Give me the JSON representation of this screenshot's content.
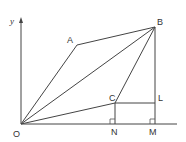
{
  "diagram": {
    "axis_label_y": "y",
    "points": {
      "O": {
        "label": "O",
        "x": 21,
        "y": 124
      },
      "A": {
        "label": "A",
        "x": 77,
        "y": 45
      },
      "B": {
        "label": "B",
        "x": 155,
        "y": 27
      },
      "C": {
        "label": "C",
        "x": 115,
        "y": 103
      },
      "L": {
        "label": "L",
        "x": 155,
        "y": 103
      },
      "N": {
        "label": "N",
        "x": 115,
        "y": 124
      },
      "M": {
        "label": "M",
        "x": 155,
        "y": 124
      }
    },
    "segments": [
      [
        "O",
        "A"
      ],
      [
        "A",
        "B"
      ],
      [
        "O",
        "B"
      ],
      [
        "O",
        "C"
      ],
      [
        "C",
        "B"
      ],
      [
        "C",
        "L"
      ],
      [
        "B",
        "M"
      ],
      [
        "C",
        "N"
      ]
    ],
    "right_angles": [
      "N",
      "M"
    ],
    "colors": {
      "line": "#444444",
      "text": "#333333"
    }
  }
}
